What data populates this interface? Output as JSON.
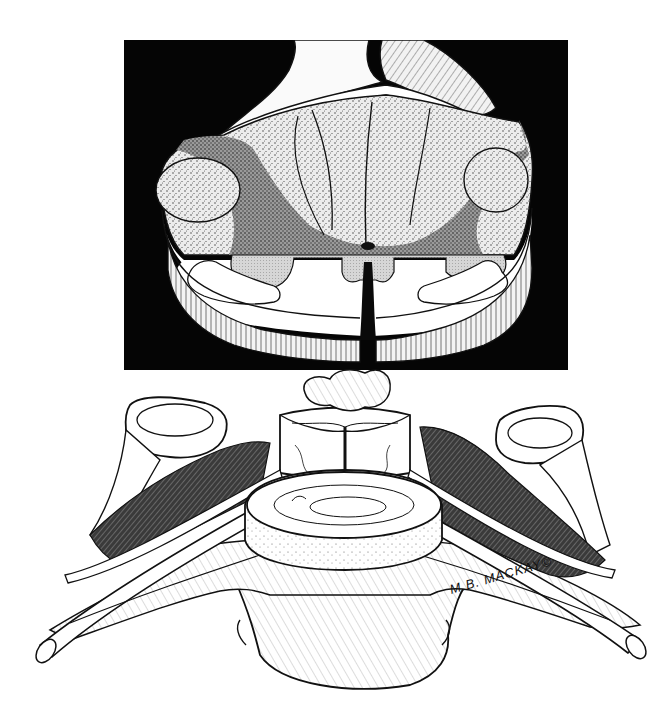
{
  "page": {
    "cropped_header_text": "",
    "background": "#ffffff"
  },
  "figures": [
    {
      "id": "spinal-cord-cross-section",
      "description": "Transverse section of spinal cord on black background with dorsal roots emerging",
      "background_color": "#050505",
      "box": {
        "x": 124,
        "y": 40,
        "width": 444,
        "height": 330
      }
    },
    {
      "id": "cervical-vertebra",
      "description": "Cervical vertebra with spinal cord segment and emerging spinal nerves",
      "box": {
        "x": 30,
        "y": 365,
        "width": 620,
        "height": 340
      }
    }
  ],
  "signature": {
    "text": "M.B. MACKAY©"
  },
  "colors": {
    "ink": "#111111",
    "stipple_light": "#d9d9d9",
    "stipple_dark": "#8a8a8a",
    "gray_matter": "#c8c8c8",
    "paper": "#ffffff"
  }
}
